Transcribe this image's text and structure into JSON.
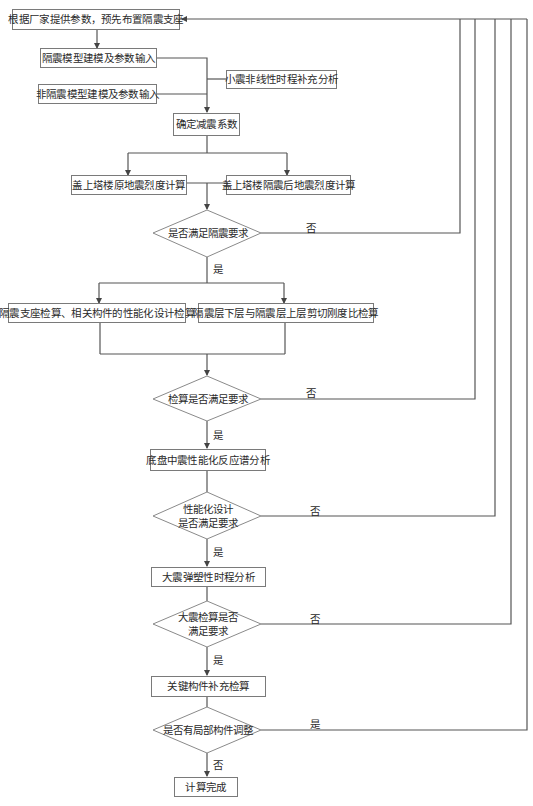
{
  "diagram": {
    "type": "flowchart",
    "nodes": {
      "start": "根据厂家提供参数，预先布置隔震支座",
      "iso_model": "隔震模型建模及参数输入",
      "noniso_model": "非隔震模型建模及参数输入",
      "small_eq": "小震非线性时程补充分析",
      "damping": "确定减震系数",
      "orig_intensity": "盖上塔楼原地震烈度计算",
      "iso_intensity": "盖上塔楼隔震后地震烈度计算",
      "dec1": "是否满足隔震要求",
      "bearing_check": "隔震支座检算、相关构件的性能化设计检算",
      "stiffness_check": "隔震层下层与隔震层上层剪切刚度比检算",
      "dec2": "检算是否满足要求",
      "mid_eq": "底盘中震性能化反应谱分析",
      "dec3_line1": "性能化设计",
      "dec3_line2": "是否满足要求",
      "large_eq": "大震弹塑性时程分析",
      "dec4_line1": "大震检算是否",
      "dec4_line2": "满足要求",
      "key_members": "关键构件补充检算",
      "dec5": "是否有局部构件调整",
      "done": "计算完成"
    },
    "labels": {
      "yes": "是",
      "no": "否"
    },
    "colors": {
      "line": "#555555",
      "box_border": "#7a7a7a",
      "text": "#2a2a2a"
    }
  }
}
